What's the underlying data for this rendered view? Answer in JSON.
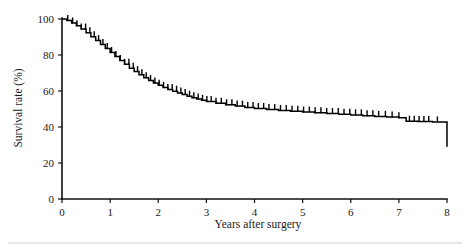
{
  "chart_data": {
    "type": "line",
    "title": "",
    "subtitle": "",
    "xlabel": "Years after surgery",
    "ylabel": "Survival rate (%)",
    "xlim": [
      0,
      8
    ],
    "ylim": [
      0,
      100
    ],
    "xticks": [
      0,
      1,
      2,
      3,
      4,
      5,
      6,
      7,
      8
    ],
    "xtick_labels": [
      "0",
      "1",
      "2",
      "3",
      "4",
      "5",
      "6",
      "7",
      "8"
    ],
    "yticks": [
      0,
      20,
      40,
      60,
      80,
      100
    ],
    "ytick_labels": [
      "0",
      "20",
      "40",
      "60",
      "80",
      "100"
    ],
    "grid": false,
    "legend": null,
    "legend_position": "none",
    "style_note": "Kaplan-Meier step survival curve with censoring tick marks along the curve",
    "series": [
      {
        "name": "Overall survival",
        "x": [
          0.0,
          0.1,
          0.2,
          0.3,
          0.4,
          0.5,
          0.6,
          0.7,
          0.8,
          0.9,
          1.0,
          1.1,
          1.2,
          1.3,
          1.4,
          1.5,
          1.6,
          1.7,
          1.8,
          1.9,
          2.0,
          2.1,
          2.2,
          2.3,
          2.4,
          2.5,
          2.6,
          2.7,
          2.8,
          2.9,
          3.0,
          3.2,
          3.4,
          3.6,
          3.8,
          4.0,
          4.25,
          4.5,
          4.75,
          5.0,
          5.25,
          5.5,
          5.75,
          6.0,
          6.25,
          6.5,
          6.75,
          7.0,
          7.15,
          7.4,
          7.7,
          8.0
        ],
        "y": [
          100.0,
          99.2,
          97.8,
          96.2,
          94.4,
          92.4,
          90.2,
          88.0,
          85.8,
          83.6,
          81.4,
          79.2,
          77.0,
          74.8,
          72.7,
          70.8,
          69.0,
          67.4,
          65.9,
          64.5,
          63.2,
          62.0,
          60.9,
          59.9,
          58.9,
          58.0,
          57.1,
          56.3,
          55.5,
          54.8,
          54.1,
          53.2,
          52.3,
          51.6,
          50.9,
          50.3,
          49.7,
          49.2,
          48.7,
          48.3,
          47.9,
          47.5,
          47.1,
          46.7,
          46.3,
          45.9,
          45.5,
          45.1,
          43.2,
          43.0,
          42.8,
          42.6
        ],
        "final_drop_to": 29.0,
        "final_drop_x": 8.0
      }
    ],
    "censor_x": [
      0.12,
      0.22,
      0.31,
      0.4,
      0.49,
      0.58,
      0.67,
      0.76,
      0.85,
      0.94,
      1.03,
      1.12,
      1.21,
      1.3,
      1.39,
      1.48,
      1.57,
      1.66,
      1.75,
      1.84,
      1.93,
      2.02,
      2.11,
      2.2,
      2.29,
      2.38,
      2.47,
      2.56,
      2.65,
      2.74,
      2.83,
      2.92,
      3.01,
      3.1,
      3.2,
      3.31,
      3.42,
      3.53,
      3.64,
      3.75,
      3.86,
      3.97,
      4.08,
      4.19,
      4.3,
      4.42,
      4.54,
      4.66,
      4.78,
      4.9,
      5.02,
      5.14,
      5.26,
      5.38,
      5.5,
      5.62,
      5.74,
      5.86,
      5.98,
      6.1,
      6.22,
      6.34,
      6.46,
      6.58,
      6.72,
      6.86,
      7.0,
      7.22,
      7.32,
      7.42,
      7.52,
      7.62,
      7.8
    ]
  },
  "axes": {
    "y_title": "Survival rate (%)",
    "x_title": "Years after surgery"
  },
  "colors": {
    "curve": "#000000",
    "axis": "#111111",
    "text": "#1a1a1a",
    "background": "#ffffff"
  }
}
